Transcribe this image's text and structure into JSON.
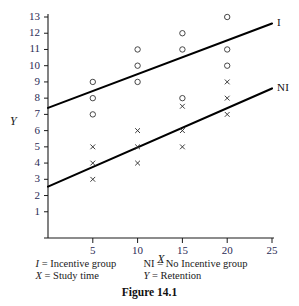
{
  "chart_data": {
    "type": "scatter",
    "title": "",
    "xlabel": "X",
    "ylabel": "Y",
    "xlim": [
      0,
      25
    ],
    "ylim": [
      0,
      13
    ],
    "xticks": [
      5,
      10,
      15,
      20,
      25
    ],
    "yticks": [
      1,
      2,
      3,
      4,
      5,
      6,
      7,
      8,
      9,
      10,
      11,
      12,
      13
    ],
    "grid": false,
    "legend_position": "right-of-lines",
    "series": [
      {
        "name": "I",
        "label": "I",
        "marker": "circle",
        "description": "Incentive group",
        "points": [
          {
            "x": 5,
            "y": 9
          },
          {
            "x": 5,
            "y": 8
          },
          {
            "x": 5,
            "y": 7
          },
          {
            "x": 10,
            "y": 11
          },
          {
            "x": 10,
            "y": 10
          },
          {
            "x": 10,
            "y": 9
          },
          {
            "x": 15,
            "y": 12
          },
          {
            "x": 15,
            "y": 11
          },
          {
            "x": 15,
            "y": 8
          },
          {
            "x": 20,
            "y": 13
          },
          {
            "x": 20,
            "y": 11
          },
          {
            "x": 20,
            "y": 10
          }
        ],
        "fit_line": {
          "x0": 0,
          "y0": 7.4,
          "x1": 25,
          "y1": 12.6
        }
      },
      {
        "name": "NI",
        "label": "NI",
        "marker": "cross",
        "description": "No Incentive group",
        "points": [
          {
            "x": 5,
            "y": 5
          },
          {
            "x": 5,
            "y": 4
          },
          {
            "x": 5,
            "y": 3
          },
          {
            "x": 10,
            "y": 6
          },
          {
            "x": 10,
            "y": 5
          },
          {
            "x": 10,
            "y": 4
          },
          {
            "x": 15,
            "y": 7.5
          },
          {
            "x": 15,
            "y": 6
          },
          {
            "x": 15,
            "y": 5
          },
          {
            "x": 20,
            "y": 9
          },
          {
            "x": 20,
            "y": 8
          },
          {
            "x": 20,
            "y": 7
          }
        ],
        "fit_line": {
          "x0": 0,
          "y0": 2.55,
          "x1": 25,
          "y1": 8.6
        }
      }
    ]
  },
  "legend": {
    "line1_left_key": "I",
    "line1_left_text": "= Incentive group",
    "line1_right_key": "NI",
    "line1_right_text": "= No Incentive group",
    "line2_left_key": "X",
    "line2_left_text": "= Study time",
    "line2_right_key": "Y",
    "line2_right_text": "= Retention"
  },
  "caption": "Figure 14.1",
  "colors": {
    "axis": "#1a1a1a",
    "tick_label": "#2b2b55",
    "marker": "#333333",
    "fit_line": "#000000",
    "background": "#ffffff"
  }
}
